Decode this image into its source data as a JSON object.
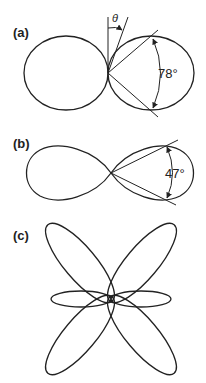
{
  "panels": [
    {
      "label": "(a)",
      "angle_label": "78°",
      "theta_label": "θ",
      "shape": "dipole-circles"
    },
    {
      "label": "(b)",
      "angle_label": "47°",
      "shape": "figure-eight-lobes"
    },
    {
      "label": "(c)",
      "shape": "six-petal-rose"
    }
  ],
  "colors": {
    "stroke": "#222222",
    "background": "#ffffff"
  }
}
